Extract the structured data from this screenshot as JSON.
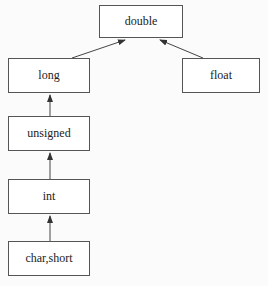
{
  "diagram": {
    "nodes": [
      {
        "id": "double",
        "label": "double",
        "x": 99,
        "y": 5,
        "w": 84,
        "h": 33
      },
      {
        "id": "long",
        "label": "long",
        "x": 8,
        "y": 58,
        "w": 82,
        "h": 35
      },
      {
        "id": "float",
        "label": "float",
        "x": 182,
        "y": 58,
        "w": 78,
        "h": 35
      },
      {
        "id": "unsigned",
        "label": "unsigned",
        "x": 8,
        "y": 116,
        "w": 82,
        "h": 35
      },
      {
        "id": "int",
        "label": "int",
        "x": 8,
        "y": 179,
        "w": 82,
        "h": 35
      },
      {
        "id": "char_short",
        "label": "char,short",
        "x": 8,
        "y": 241,
        "w": 82,
        "h": 35
      }
    ],
    "edges": [
      {
        "from": "long",
        "to": "double"
      },
      {
        "from": "float",
        "to": "double"
      },
      {
        "from": "unsigned",
        "to": "long"
      },
      {
        "from": "int",
        "to": "unsigned"
      },
      {
        "from": "char_short",
        "to": "int"
      }
    ]
  }
}
